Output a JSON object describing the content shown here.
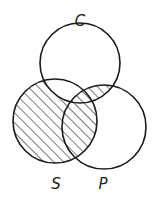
{
  "diagram": {
    "type": "venn-3",
    "stroke_color": "#1a1a1a",
    "hatch_color": "#333333",
    "sets": [
      {
        "id": "C",
        "label": "C",
        "cx": 80,
        "cy": 63,
        "r": 40,
        "label_x": 80,
        "label_y": 26
      },
      {
        "id": "S",
        "label": "S",
        "cx": 55,
        "cy": 121,
        "r": 42,
        "label_x": 56,
        "label_y": 189
      },
      {
        "id": "P",
        "label": "P",
        "cx": 104,
        "cy": 127,
        "r": 42,
        "label_x": 103,
        "label_y": 189
      }
    ],
    "shaded_regions": [
      "S only",
      "S∩P only",
      "S∩C∩P",
      "C∩P only"
    ],
    "unshaded_regions": [
      "C only",
      "P only",
      "S∩C only",
      "outside"
    ]
  }
}
